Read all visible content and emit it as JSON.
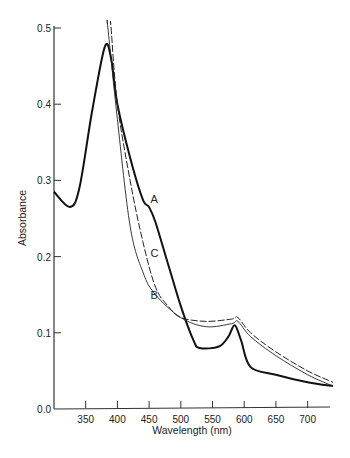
{
  "chart_data": {
    "type": "line",
    "title": "",
    "xlabel": "Wavelength (nm)",
    "ylabel": "Absorbance",
    "xlim": [
      300,
      740
    ],
    "ylim": [
      0,
      0.5
    ],
    "grid": false,
    "x_ticks": [
      350,
      400,
      450,
      500,
      550,
      600,
      650,
      700
    ],
    "x_tick_labels": [
      "350",
      "400",
      "450",
      "500",
      "550",
      "600",
      "650",
      "700"
    ],
    "y_ticks": [
      0.0,
      0.1,
      0.2,
      0.3,
      0.4,
      0.5
    ],
    "y_tick_labels": [
      "0.0",
      "0.1",
      "0.2",
      "0.3",
      "0.4",
      "0.5"
    ],
    "series": [
      {
        "name": "A",
        "style": "thick-solid",
        "label_at": [
          452,
          0.27
        ],
        "x": [
          300,
          325,
          340,
          360,
          380,
          390,
          400,
          420,
          440,
          450,
          460,
          480,
          500,
          520,
          530,
          560,
          575,
          585,
          595,
          610,
          650,
          700,
          740
        ],
        "y": [
          0.285,
          0.265,
          0.29,
          0.39,
          0.475,
          0.46,
          0.4,
          0.33,
          0.275,
          0.265,
          0.245,
          0.19,
          0.135,
          0.09,
          0.08,
          0.082,
          0.095,
          0.11,
          0.09,
          0.055,
          0.045,
          0.035,
          0.03
        ]
      },
      {
        "name": "B",
        "style": "thin-solid",
        "label_at": [
          452,
          0.145
        ],
        "x": [
          385,
          400,
          420,
          440,
          460,
          500,
          540,
          580,
          590,
          610,
          650,
          700,
          740
        ],
        "y": [
          0.5,
          0.38,
          0.24,
          0.18,
          0.15,
          0.12,
          0.108,
          0.112,
          0.115,
          0.095,
          0.07,
          0.045,
          0.03
        ]
      },
      {
        "name": "C",
        "style": "dashed",
        "label_at": [
          452,
          0.2
        ],
        "x": [
          390,
          400,
          420,
          440,
          460,
          480,
          500,
          540,
          580,
          590,
          610,
          650,
          700,
          740
        ],
        "y": [
          0.5,
          0.4,
          0.3,
          0.22,
          0.16,
          0.135,
          0.12,
          0.115,
          0.118,
          0.12,
          0.1,
          0.075,
          0.05,
          0.035
        ]
      }
    ]
  }
}
